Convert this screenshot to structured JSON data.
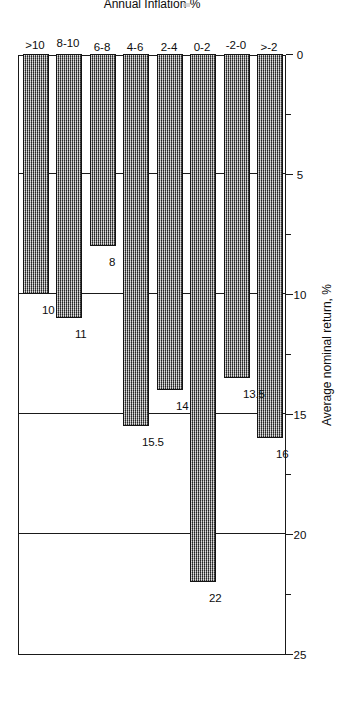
{
  "chart_data": {
    "type": "bar",
    "orientation": "horizontal",
    "title": "",
    "xlabel": "Average nominal return, %",
    "ylabel": "Annual Inflation %",
    "categories": [
      ">-2",
      "-2-0",
      "0-2",
      "2-4",
      "4-6",
      "6-8",
      "8-10",
      ">10"
    ],
    "values": [
      16,
      13.5,
      22,
      14,
      15.5,
      8,
      11,
      10
    ],
    "value_labels": [
      "16",
      "13.5",
      "22",
      "14",
      "15.5",
      "8",
      "11",
      "10"
    ],
    "xlim": [
      0,
      25
    ],
    "ylim": [
      0,
      8
    ],
    "x_ticks": [
      0,
      5,
      10,
      15,
      20,
      25
    ],
    "x_tick_labels": [
      "0",
      "5",
      "10",
      "15",
      "20",
      "25"
    ],
    "x_minor_ticks": [
      2.5,
      7.5,
      12.5,
      17.5,
      22.5
    ],
    "gridlines": [
      5,
      10,
      15,
      20
    ],
    "grid": true,
    "legend": false,
    "legend_position": "none",
    "bar_fill": "#8a8a8a",
    "bar_edge": "#141414",
    "axis_color": "#1a1a1a",
    "rotation_deg": 270
  },
  "axis": {
    "value_axis_title": "Average nominal return, %",
    "category_axis_title": "Annual Inflation %"
  }
}
